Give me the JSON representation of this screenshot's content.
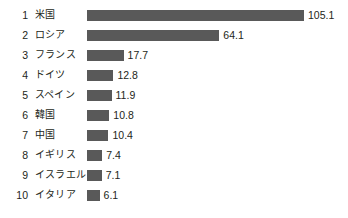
{
  "chart_data": {
    "type": "bar",
    "orientation": "horizontal",
    "title": "",
    "subtitle": "",
    "xlabel": "",
    "ylabel": "",
    "grid": false,
    "legend": null,
    "axis_visible": false,
    "value_labels_shown": true,
    "xlim": [
      0,
      105.1
    ],
    "bar_color": "#595959",
    "text_color": "#231f20",
    "background_color": "#ffffff",
    "categories": [
      "米国",
      "ロシア",
      "フランス",
      "ドイツ",
      "スペイン",
      "韓国",
      "中国",
      "イギリス",
      "イスラエル",
      "イタリア"
    ],
    "values": [
      105.1,
      64.1,
      17.7,
      12.8,
      11.9,
      10.8,
      10.4,
      7.4,
      7.1,
      6.1
    ],
    "ranks": [
      "1",
      "2",
      "3",
      "4",
      "5",
      "6",
      "7",
      "8",
      "9",
      "10"
    ],
    "rows": [
      {
        "rank": "1",
        "name": "米国",
        "value": 105.1,
        "value_label": "105.1"
      },
      {
        "rank": "2",
        "name": "ロシア",
        "value": 64.1,
        "value_label": "64.1"
      },
      {
        "rank": "3",
        "name": "フランス",
        "value": 17.7,
        "value_label": "17.7"
      },
      {
        "rank": "4",
        "name": "ドイツ",
        "value": 12.8,
        "value_label": "12.8"
      },
      {
        "rank": "5",
        "name": "スペイン",
        "value": 11.9,
        "value_label": "11.9"
      },
      {
        "rank": "6",
        "name": "韓国",
        "value": 10.8,
        "value_label": "10.8"
      },
      {
        "rank": "7",
        "name": "中国",
        "value": 10.4,
        "value_label": "10.4"
      },
      {
        "rank": "8",
        "name": "イギリス",
        "value": 7.4,
        "value_label": "7.4"
      },
      {
        "rank": "9",
        "name": "イスラエル",
        "value": 7.1,
        "value_label": "7.1"
      },
      {
        "rank": "10",
        "name": "イタリア",
        "value": 6.1,
        "value_label": "6.1"
      }
    ]
  },
  "layout": {
    "row_pitch_px": 20,
    "first_row_top_px": 5,
    "bar_origin_px": 87,
    "px_per_unit": 2.065,
    "bar_height_px": 11
  }
}
